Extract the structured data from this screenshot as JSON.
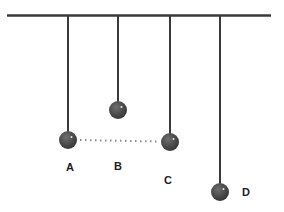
{
  "diagram": {
    "type": "pendulum-length-comparison",
    "background_color": "#ffffff",
    "support_bar": {
      "x1": 7,
      "x2": 271,
      "y": 15.5,
      "thickness": 2.5,
      "color": "#3a3a3a"
    },
    "string_style": {
      "color": "#3a3a3a",
      "width": 2
    },
    "bob_style": {
      "radius": 9,
      "fill_center": "#6f6f6f",
      "fill_mid": "#4a4a4a",
      "fill_edge": "#2f2f2f",
      "highlight_color": "#e9e9e9"
    },
    "label_style": {
      "color": "#1c1c1c",
      "font_size": 11
    },
    "pendulums": [
      {
        "label": "A",
        "string_x": 68,
        "top_y": 16,
        "bob_cy": 140,
        "label_x": 70,
        "label_y": 171
      },
      {
        "label": "B",
        "string_x": 118,
        "top_y": 16,
        "bob_cy": 110,
        "label_x": 118,
        "label_y": 170
      },
      {
        "label": "C",
        "string_x": 170,
        "top_y": 16,
        "bob_cy": 142,
        "label_x": 168,
        "label_y": 184
      },
      {
        "label": "D",
        "string_x": 220,
        "top_y": 16,
        "bob_cy": 192,
        "label_x": 246,
        "label_y": 196
      }
    ],
    "dotted_line": {
      "connects": [
        "A",
        "C"
      ],
      "x1": 80,
      "y1": 140,
      "x2": 159,
      "y2": 141.5,
      "color": "#8a8a8a",
      "width": 2,
      "dash": "1.5 3.5"
    }
  }
}
